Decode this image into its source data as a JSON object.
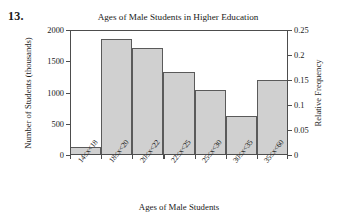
{
  "problem_number": "13.",
  "chart_data": {
    "type": "bar",
    "title": "Ages of Male Students in Higher Education",
    "xlabel": "Ages of Male Students",
    "ylabel": "Number of Students (thousands)",
    "ylabel_secondary": "Relative Frequency",
    "categories": [
      "14≤x<18",
      "18≤x<20",
      "20≤x<22",
      "22≤x<25",
      "25≤x<30",
      "30≤x<35",
      "35≤x<60"
    ],
    "values": [
      130,
      1850,
      1710,
      1330,
      1040,
      630,
      1200
    ],
    "relative_frequency": [
      0.016,
      0.231,
      0.214,
      0.166,
      0.13,
      0.079,
      0.15
    ],
    "ylim": [
      0,
      2000
    ],
    "ylim_secondary": [
      0,
      0.25
    ],
    "yticks": [
      0,
      500,
      1000,
      1500,
      2000
    ],
    "ytick_labels": [
      "0",
      "500",
      "1000",
      "1500",
      "2000"
    ],
    "yticks_secondary": [
      0,
      0.05,
      0.1,
      0.15,
      0.2,
      0.25
    ],
    "ytick_labels_secondary": [
      "0",
      "0.05",
      "0.1",
      "0.15",
      "0.2",
      "0.25"
    ],
    "grid": false,
    "legend": "none",
    "bar_color": "#d0d0d0",
    "bar_edge_color": "#5a5a5a",
    "axis_color": "#4d4d4d"
  }
}
